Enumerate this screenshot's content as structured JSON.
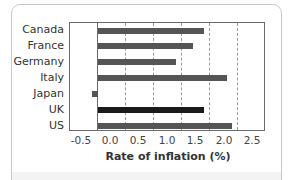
{
  "chart_data": {
    "type": "bar",
    "orientation": "horizontal",
    "title": "",
    "xlabel": "Rate of inflation (%)",
    "ylabel": "",
    "categories": [
      "Canada",
      "France",
      "Germany",
      "Italy",
      "Japan",
      "UK",
      "US"
    ],
    "values": [
      1.9,
      1.7,
      1.4,
      2.3,
      -0.1,
      1.9,
      2.4
    ],
    "highlight": "UK",
    "xlim": [
      -0.5,
      3.0
    ],
    "xticks": [
      "-0.5",
      "0.0",
      "0.5",
      "1.0",
      "1.5",
      "2.0",
      "2.5"
    ],
    "grid": "vertical dashed",
    "legend": null
  },
  "colors": {
    "bar": "#555555",
    "highlight_bar": "#1a1a1a",
    "grid": "#9a9a9a",
    "frame": "#6a6a6a"
  },
  "axis": {
    "xlabel": "Rate of inflation (%)",
    "ticks": [
      "-0.5",
      "0.0",
      "0.5",
      "1.0",
      "1.5",
      "2.0",
      "2.5"
    ]
  },
  "categories": [
    "Canada",
    "France",
    "Germany",
    "Italy",
    "Japan",
    "UK",
    "US"
  ]
}
